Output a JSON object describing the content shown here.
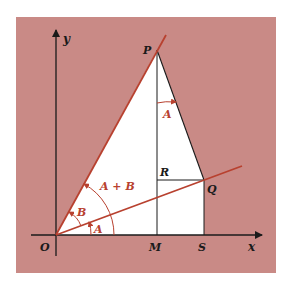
{
  "diagram": {
    "colors": {
      "background": "#c98a86",
      "triangle_fill": "#ffffff",
      "accent": "#b8412f",
      "ink": "#1a1a1a"
    },
    "labels": {
      "y_axis": "y",
      "x_axis": "x",
      "origin": "O",
      "P": "P",
      "Q": "Q",
      "R": "R",
      "M": "M",
      "S": "S",
      "angle_A_origin": "A",
      "angle_B": "B",
      "angle_A_plus_B": "A + B",
      "angle_A_at_P": "A"
    }
  }
}
